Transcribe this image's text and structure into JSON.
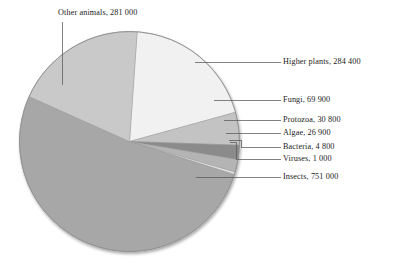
{
  "chart_data": {
    "type": "pie",
    "title": "",
    "subtitle": "",
    "xlabel": "",
    "ylabel": "",
    "legend_position": "callout-labels",
    "grid": false,
    "value_separator": "space",
    "total": 1450800,
    "categories": [
      "Higher plants",
      "Fungi",
      "Protozoa",
      "Algae",
      "Bacteria",
      "Viruses",
      "Insects",
      "Other animals"
    ],
    "values": [
      284400,
      69900,
      30800,
      26900,
      4800,
      1000,
      751000,
      281000
    ],
    "value_labels": [
      "284 400",
      "69 900",
      "30 800",
      "26 900",
      "4 800",
      "1 000",
      "751 000",
      "281 000"
    ],
    "slices": [
      {
        "name": "Higher plants",
        "value": 284400,
        "value_label": "284 400",
        "label": "Higher plants, 284 400",
        "color": "#f1f1f1",
        "start_angle": 4.0,
        "sweep": 70.6
      },
      {
        "name": "Fungi",
        "value": 69900,
        "value_label": "69 900",
        "label": "Fungi, 69 900",
        "color": "#c3c3c3",
        "start_angle": 74.6,
        "sweep": 17.3
      },
      {
        "name": "Protozoa",
        "value": 30800,
        "value_label": "30 800",
        "label": "Protozoa, 30 800",
        "color": "#8b8b8b",
        "start_angle": 91.9,
        "sweep": 7.6
      },
      {
        "name": "Algae",
        "value": 26900,
        "value_label": "26 900",
        "label": "Algae, 26 900",
        "color": "#b4b4b4",
        "start_angle": 99.5,
        "sweep": 6.7
      },
      {
        "name": "Bacteria",
        "value": 4800,
        "value_label": "4 800",
        "label": "Bacteria, 4 800",
        "color": "#e8e8e8",
        "start_angle": 106.2,
        "sweep": 1.2
      },
      {
        "name": "Viruses",
        "value": 1000,
        "value_label": "1 000",
        "label": "Viruses, 1 000",
        "color": "#f6f6f6",
        "start_angle": 107.4,
        "sweep": 0.3
      },
      {
        "name": "Insects",
        "value": 751000,
        "value_label": "751 000",
        "label": "Insects, 751 000",
        "color": "#a7a7a7",
        "start_angle": 107.7,
        "sweep": 186.4
      },
      {
        "name": "Other animals",
        "value": 281000,
        "value_label": "281 000",
        "label": "Other animals, 281 000",
        "color": "#c9c9c9",
        "start_angle": 294.1,
        "sweep": 69.9
      }
    ]
  },
  "labels": {
    "higher_plants": "Higher plants, 284 400",
    "fungi": "Fungi, 69 900",
    "protozoa": "Protozoa, 30 800",
    "algae": "Algae, 26 900",
    "bacteria": "Bacteria, 4 800",
    "viruses": "Viruses, 1 000",
    "insects": "Insects, 751 000",
    "other_animals": "Other animals, 281 000"
  },
  "style": {
    "background": "#ffffff",
    "text_color": "#1b1b1b",
    "leader_line_color": "#5a5a5a",
    "pie_outline_color": "#8f8f8f"
  }
}
